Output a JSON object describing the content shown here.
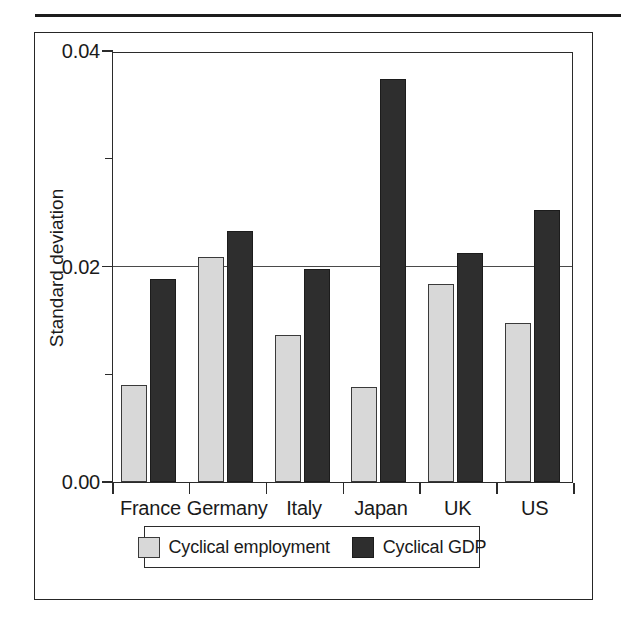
{
  "figure": {
    "has_top_rule": true,
    "has_outer_box": true
  },
  "chart_data": {
    "type": "bar",
    "title": "",
    "xlabel": "",
    "ylabel": "Standard deviation",
    "categories": [
      "France",
      "Germany",
      "Italy",
      "Japan",
      "UK",
      "US"
    ],
    "series": [
      {
        "name": "Cyclical employment",
        "color": "#d8d8d8",
        "values": [
          0.009,
          0.0209,
          0.0136,
          0.0088,
          0.0184,
          0.0148
        ]
      },
      {
        "name": "Cyclical GDP",
        "color": "#2e2e2e",
        "values": [
          0.0188,
          0.0233,
          0.0198,
          0.0374,
          0.0213,
          0.0252
        ]
      }
    ],
    "ylim": [
      0.0,
      0.04
    ],
    "y_major_ticks": [
      0.0,
      0.02,
      0.04
    ],
    "y_major_tick_labels": [
      "0.00",
      "0.02",
      "0.04"
    ],
    "y_minor_ticks": [
      0.01,
      0.03
    ],
    "gridlines": [
      0.02
    ],
    "grid": "single horizontal gridline at 0.02",
    "legend_position": "below-axis-center"
  },
  "axis": {
    "y_labels": [
      "0.04",
      "0.02",
      "0.00"
    ],
    "title": "Standard deviation"
  },
  "legend": {
    "entries": [
      {
        "label": "Cyclical employment",
        "swatch": "light-gray-square"
      },
      {
        "label": "Cyclical GDP",
        "swatch": "dark-square"
      }
    ]
  }
}
